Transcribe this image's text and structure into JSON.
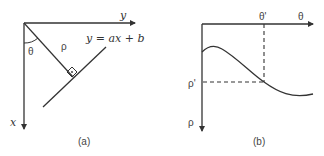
{
  "panel_a": {
    "caption": "(a)",
    "y_axis_label": "y",
    "x_axis_label": "x",
    "line_equation": "y = ax + b",
    "rho_label": "ρ",
    "theta_label": "θ"
  },
  "panel_b": {
    "caption": "(b)",
    "theta_axis_label": "θ",
    "rho_axis_label": "ρ",
    "theta_prime_label": "θ'",
    "rho_prime_label": "ρ'"
  },
  "colors": {
    "stroke": "#333333",
    "text": "#333333",
    "background": "#ffffff"
  }
}
